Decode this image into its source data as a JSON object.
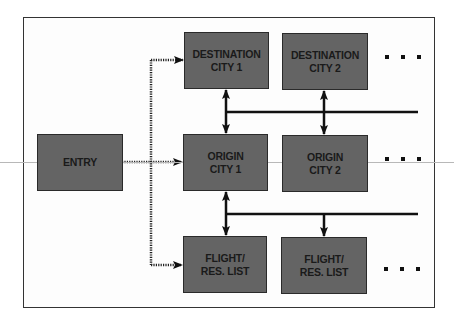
{
  "diagram": {
    "nodes": {
      "entry": {
        "label": "ENTRY"
      },
      "destination_city_1": {
        "label": "DESTINATION\nCITY 1"
      },
      "destination_city_2": {
        "label": "DESTINATION\nCITY 2"
      },
      "origin_city_1": {
        "label": "ORIGIN\nCITY 1"
      },
      "origin_city_2": {
        "label": "ORIGIN\nCITY 2"
      },
      "flight_list_1": {
        "label": "FLIGHT/\nRES. LIST"
      },
      "flight_list_2": {
        "label": "FLIGHT/\nRES. LIST"
      }
    },
    "ellipses": {
      "row_destination": "...",
      "row_origin": "...",
      "row_flight": "..."
    },
    "edges": [
      {
        "from": "entry",
        "to": "destination_city_1",
        "style": "dotted"
      },
      {
        "from": "entry",
        "to": "origin_city_1",
        "style": "dotted"
      },
      {
        "from": "entry",
        "to": "flight_list_1",
        "style": "dotted"
      },
      {
        "from": "destination_city_1",
        "to": "origin_city_1",
        "style": "solid",
        "bidirectional": true
      },
      {
        "from": "destination_city_2",
        "to": "origin_city_2",
        "style": "solid",
        "bidirectional": true
      },
      {
        "from": "origin_city_1",
        "to": "flight_list_1",
        "style": "solid",
        "bidirectional": true
      },
      {
        "from": "origin_city_1",
        "to": "flight_list_2",
        "style": "solid",
        "bidirectional": false
      }
    ],
    "colors": {
      "node_fill": "#646464",
      "node_border": "#2a2a2a",
      "line": "#111111",
      "frame": "#333333"
    }
  }
}
